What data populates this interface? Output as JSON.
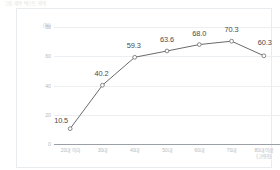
{
  "top_caption": "그림 제목 텍스트 영역",
  "chart_data": {
    "type": "line",
    "title": "",
    "subtitle": "",
    "xlabel": "",
    "ylabel": "",
    "y_unit": "(%)",
    "categories": [
      "20대 이하",
      "30대",
      "40대",
      "50대",
      "60대",
      "70대",
      "80대 이상"
    ],
    "category_sublabels": [
      "",
      "",
      "",
      "",
      "",
      "",
      "(고령층)"
    ],
    "values": [
      10.5,
      40.2,
      59.3,
      63.6,
      68.0,
      70.3,
      60.3
    ],
    "value_labels": [
      "10.5",
      "40.2",
      "59.3",
      "63.6",
      "68.0",
      "70.3",
      "60.3"
    ],
    "ylim": [
      0,
      80
    ],
    "y_ticks": [
      0,
      20,
      40,
      60,
      80
    ],
    "y_tick_labels": [
      "0",
      "20",
      "40",
      "60",
      "80"
    ],
    "grid": true,
    "legend": false,
    "series_color": "#6b6b6b",
    "marker": "open-circle",
    "marker_fill": "#ffffff",
    "label_color": "#4a4a4a",
    "tick_color": "#b4babf",
    "axis_color": "#9aa0a6",
    "grid_color": "#eceff1",
    "frame_color": "#e9ecef",
    "background": "#ffffff"
  }
}
